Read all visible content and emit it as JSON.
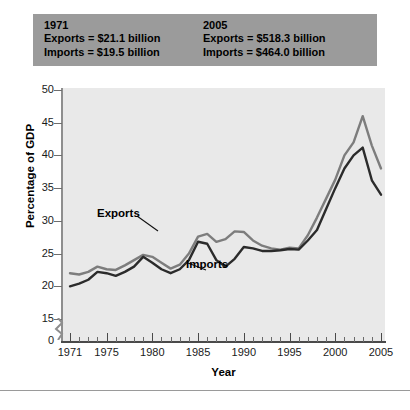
{
  "header": {
    "left": {
      "year": "1971",
      "exports": "Exports = $21.1 billion",
      "imports": "Imports = $19.5 billion"
    },
    "right": {
      "year": "2005",
      "exports": "Exports = $518.3 billion",
      "imports": "Imports = $464.0 billion"
    }
  },
  "labels": {
    "exports": "Exports",
    "imports": "Imports"
  },
  "colors": {
    "exports_line": "#7d7d7d",
    "imports_line": "#2b2b2b",
    "plot_bg": "#e9e9e9",
    "header_bg": "#9b9b9b",
    "axis": "#4a4a4a"
  },
  "chart_data": {
    "type": "line",
    "title": "",
    "xlabel": "Year",
    "ylabel": "Percentage of GDP",
    "xlim": [
      1971,
      2005
    ],
    "ylim": [
      0,
      50
    ],
    "yticks": [
      0,
      15,
      20,
      25,
      30,
      35,
      40,
      45,
      50
    ],
    "ytick_labels": [
      "0",
      "15",
      "20",
      "25",
      "30",
      "35",
      "40",
      "45",
      "50"
    ],
    "y_axis_break": true,
    "y_break_between": [
      0,
      15
    ],
    "xticks": [
      1971,
      1975,
      1980,
      1985,
      1990,
      1995,
      2000,
      2005
    ],
    "xtick_labels": [
      "1971",
      "1975",
      "1980",
      "1985",
      "1990",
      "1995",
      "2000",
      "2005"
    ],
    "grid": false,
    "legend": "inline-annotations",
    "x": [
      1971,
      1972,
      1973,
      1974,
      1975,
      1976,
      1977,
      1978,
      1979,
      1980,
      1981,
      1982,
      1983,
      1984,
      1985,
      1986,
      1987,
      1988,
      1989,
      1990,
      1991,
      1992,
      1993,
      1994,
      1995,
      1996,
      1997,
      1998,
      1999,
      2000,
      2001,
      2002,
      2003,
      2004,
      2005
    ],
    "series": [
      {
        "name": "Exports",
        "color": "#7d7d7d",
        "values": [
          22.0,
          21.8,
          22.2,
          23.0,
          22.6,
          22.5,
          23.2,
          24.0,
          24.8,
          24.5,
          23.6,
          22.7,
          23.3,
          25.0,
          27.6,
          28.0,
          26.8,
          27.2,
          28.4,
          28.3,
          27.0,
          26.2,
          25.8,
          25.6,
          25.9,
          25.8,
          27.8,
          30.5,
          33.4,
          36.3,
          40.0,
          42.0,
          46.0,
          41.5,
          38.0
        ]
      },
      {
        "name": "Imports",
        "color": "#2b2b2b",
        "values": [
          20.0,
          20.4,
          21.0,
          22.2,
          22.0,
          21.6,
          22.2,
          23.0,
          24.5,
          23.6,
          22.6,
          22.0,
          22.6,
          24.0,
          26.8,
          26.5,
          24.0,
          23.0,
          24.2,
          26.0,
          25.8,
          25.4,
          25.4,
          25.5,
          25.7,
          25.6,
          27.0,
          28.6,
          31.8,
          35.0,
          38.0,
          40.0,
          41.2,
          36.2,
          34.0
        ]
      }
    ]
  }
}
